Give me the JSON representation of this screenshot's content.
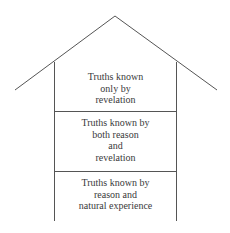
{
  "diagram": {
    "type": "house-of-truths",
    "line_color": "#555555",
    "text_color": "#3a3a3a",
    "sections": [
      {
        "id": "top",
        "lines": [
          "Truths known",
          "only by",
          "revelation"
        ]
      },
      {
        "id": "middle",
        "lines": [
          "Truths known by",
          "both reason",
          "and",
          "revelation"
        ]
      },
      {
        "id": "bottom",
        "lines": [
          "Truths known by",
          "reason and",
          "natural experience"
        ]
      }
    ]
  }
}
